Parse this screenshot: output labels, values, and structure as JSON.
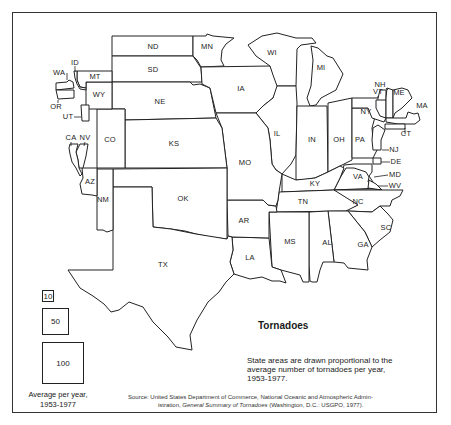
{
  "map": {
    "title": "Tornadoes",
    "caption": "State areas are drawn proportional to the average number of tornadoes per year, 1953-1977.",
    "source": {
      "prefix": "Source: United States Department of Commerce, National Oceanic and Atmospheric Admin-",
      "line2_start": "istration, ",
      "italic": "General Summary of Tornadoes",
      "line2_end": " (Washington, D.C.: USGPO, 1977)."
    },
    "legend": {
      "items": [
        {
          "label": "10",
          "size": 12
        },
        {
          "label": "50",
          "size": 27
        },
        {
          "label": "100",
          "size": 42
        }
      ],
      "caption_line1": "Average per year,",
      "caption_line2": "1953-1977"
    },
    "colors": {
      "stroke": "#222222",
      "fill": "#ffffff",
      "frame": "#333333"
    },
    "states": [
      {
        "id": "ND",
        "label": "ND",
        "label_xy": [
          153,
          47
        ],
        "points": "112,36 193,36 193,56 112,56"
      },
      {
        "id": "SD",
        "label": "SD",
        "label_xy": [
          153,
          70
        ],
        "points": "112,56 193,56 197,62 201,68 202,82 112,82"
      },
      {
        "id": "MN",
        "label": "MN",
        "label_xy": [
          207,
          47
        ],
        "points": "193,36 206,36 207,34 213,36 234,38 226,44 222,50 221,60 224,66 201,67 197,60 193,56"
      },
      {
        "id": "NE",
        "label": "NE",
        "label_xy": [
          160,
          102
        ],
        "points": "112,82 190,82 193,85 200,84 210,88 216,118 125,120 125,109 112,109"
      },
      {
        "id": "IA",
        "label": "IA",
        "label_xy": [
          241,
          89
        ],
        "points": "201,67 270,66 276,78 278,88 273,98 263,106 256,113 216,113 210,88 202,84"
      },
      {
        "id": "WI",
        "label": "WI",
        "label_xy": [
          272,
          53
        ],
        "points": "262,36 277,33 296,38 312,38 316,43 301,45 297,49 296,86 277,86 273,75 270,66 256,56 248,45"
      },
      {
        "id": "MI",
        "label": "MI",
        "label_xy": [
          321,
          68
        ],
        "points": "311,46 318,48 327,56 333,58 343,74 336,90 321,98 316,105 310,106 307,98 311,86 313,60"
      },
      {
        "id": "IL",
        "label": "IL",
        "label_xy": [
          277,
          134
        ],
        "points": "256,113 263,106 273,98 277,86 296,86 297,103 296,155 291,164 282,174 276,170 272,164 270,140 268,128"
      },
      {
        "id": "IN",
        "label": "IN",
        "label_xy": [
          312,
          140
        ],
        "points": "297,106 327,106 328,172 315,178 302,180 296,180 296,155"
      },
      {
        "id": "OH",
        "label": "OH",
        "label_xy": [
          339,
          140
        ],
        "points": "328,103 352,98 352,160 340,166 328,172"
      },
      {
        "id": "PA",
        "label": "PA",
        "label_xy": [
          360,
          140
        ],
        "points": "352,108 372,108 375,117 372,128 373,140 377,150 373,158 352,158"
      },
      {
        "id": "NY",
        "label": "NY",
        "label_xy": [
          366,
          112
        ],
        "points": "352,98 378,98 380,90 386,90 386,118 384,122 372,118 368,108 352,108"
      },
      {
        "id": "VT",
        "label": "VT",
        "label_xy": [
          378,
          92
        ],
        "points": "376,100 386,100 386,118 380,116 376,108"
      },
      {
        "id": "NH",
        "label": "NH",
        "label_xy": [
          380,
          85
        ],
        "points": "387,88 393,90 393,118 386,118 386,98"
      },
      {
        "id": "ME",
        "label": "ME",
        "label_xy": [
          399,
          93
        ],
        "points": "393,90 402,88 408,90 412,98 402,108 395,113 393,118"
      },
      {
        "id": "MA",
        "label": "MA",
        "label_xy": [
          422,
          106
        ],
        "points": "386,118 406,118 408,112 414,114 418,113 420,120 415,124 398,124 386,122"
      },
      {
        "id": "CT",
        "label": "CT",
        "label_xy": [
          406,
          134
        ],
        "points": "385,124 405,124 405,129 385,129"
      },
      {
        "id": "NJ",
        "label": "NJ",
        "label_xy": [
          394,
          150
        ],
        "points": "373,128 378,125 385,130 381,140 381,150 373,150 372,140"
      },
      {
        "id": "DE",
        "label": "DE",
        "label_xy": [
          396,
          162
        ],
        "points": "373,158 381,158 381,164 373,164"
      },
      {
        "id": "MD",
        "label": "MD",
        "label_xy": [
          395,
          175
        ],
        "points": "344,165 354,164 372,164 372,172 369,176 373,182 346,180 342,174"
      },
      {
        "id": "VA",
        "label": "VA",
        "label_xy": [
          358,
          177
        ],
        "points": "346,168 354,168 366,172 369,177 368,182 376,186 380,188 334,190 340,178"
      },
      {
        "id": "WV",
        "label": "WV",
        "label_xy": [
          395,
          186
        ],
        "points": "369,180 376,184 382,190 368,188"
      },
      {
        "id": "KY",
        "label": "KY",
        "label_xy": [
          315,
          184
        ],
        "points": "282,174 296,180 315,178 328,172 340,166 344,168 340,178 334,190 282,192"
      },
      {
        "id": "TN",
        "label": "TN",
        "label_xy": [
          303,
          202
        ],
        "points": "279,192 334,190 382,190 372,198 358,205 348,211 276,212 278,200"
      },
      {
        "id": "NC",
        "label": "NC",
        "label_xy": [
          358,
          202
        ],
        "points": "334,190 403,190 400,196 392,200 390,206 380,206 372,212 346,211 358,205"
      },
      {
        "id": "SC",
        "label": "SC",
        "label_xy": [
          386,
          228
        ],
        "points": "348,211 372,212 380,206 388,214 393,220 390,232 380,240 372,247 365,232"
      },
      {
        "id": "GA",
        "label": "GA",
        "label_xy": [
          363,
          245
        ],
        "points": "328,211 348,211 365,232 372,247 367,260 368,270 348,268 344,263 334,262"
      },
      {
        "id": "AL",
        "label": "AL",
        "label_xy": [
          327,
          243
        ],
        "points": "309,212 328,211 334,262 323,262 320,270 317,282 312,282 310,281 309,265"
      },
      {
        "id": "MS",
        "label": "MS",
        "label_xy": [
          290,
          242
        ],
        "points": "269,212 309,212 309,282 303,282 300,275 281,270 272,267"
      },
      {
        "id": "LA",
        "label": "LA",
        "label_xy": [
          250,
          258
        ],
        "points": "232,237 269,238 272,267 281,270 286,283 280,281 272,281 262,277 250,279 234,274 230,262 233,250"
      },
      {
        "id": "AR",
        "label": "AR",
        "label_xy": [
          244,
          221
        ],
        "points": "227,200 263,200 268,205 276,206 277,212 269,212 269,238 232,237 228,236"
      },
      {
        "id": "MO",
        "label": "MO",
        "label_xy": [
          245,
          163
        ],
        "points": "216,113 256,113 268,128 270,140 272,164 276,170 282,174 279,192 278,200 276,206 268,205 263,200 227,200 227,168 222,128"
      },
      {
        "id": "KS",
        "label": "KS",
        "label_xy": [
          174,
          144
        ],
        "points": "125,120 216,118 222,128 227,168 125,168"
      },
      {
        "id": "OK",
        "label": "OK",
        "label_xy": [
          183,
          199
        ],
        "points": "113,169 227,168 227,239 210,237 196,234 185,231 171,229 153,227 152,187 113,187"
      },
      {
        "id": "TX",
        "label": "TX",
        "label_xy": [
          163,
          265
        ],
        "points": "113,187 152,187 153,227 171,229 196,234 227,239 228,236 232,237 233,250 230,262 234,274 226,282 219,292 208,302 197,320 190,335 192,350 176,347 168,337 153,322 143,307 129,302 119,310 111,312 104,304 93,296 80,288 68,270 113,270"
      },
      {
        "id": "NM",
        "label": "NM",
        "label_xy": [
          103,
          200
        ],
        "points": "97,169 113,169 113,187 113,230 107,232 103,230 97,230"
      },
      {
        "id": "AZ",
        "label": "AZ",
        "label_xy": [
          90,
          182
        ],
        "points": "82,168 97,168 97,196 92,195 82,194 80,184 83,178"
      },
      {
        "id": "CO",
        "label": "CO",
        "label_xy": [
          110,
          140
        ],
        "points": "97,109 125,109 125,168 97,168"
      },
      {
        "id": "WY",
        "label": "WY",
        "label_xy": [
          99,
          95
        ],
        "points": "86,82 112,82 112,109 86,109"
      },
      {
        "id": "MT",
        "label": "MT",
        "label_xy": [
          95,
          77
        ],
        "points": "77,71 112,71 112,82 86,82 86,88 80,87 77,80"
      },
      {
        "id": "ID",
        "label": "ID",
        "label_xy": [
          75,
          63
        ],
        "points": "74,71 77,71 77,80 80,87 86,88 86,90 80,89 77,84 75,78"
      },
      {
        "id": "WA",
        "label": "WA",
        "label_xy": [
          59,
          73
        ],
        "points": "56,83 67,82 69,80 73,82 74,88 56,90"
      },
      {
        "id": "OR",
        "label": "OR",
        "label_xy": [
          56,
          107
        ],
        "points": "56,90 74,90 74,98 58,99"
      },
      {
        "id": "UT",
        "label": "UT",
        "label_xy": [
          68,
          117
        ],
        "points": "81,105 89,105 89,121 82,121"
      },
      {
        "id": "NV",
        "label": "NV",
        "label_xy": [
          85,
          138
        ],
        "points": "80,144 88,144 86,156 83,168 79,168 78,160 76,152"
      },
      {
        "id": "CA",
        "label": "CA",
        "label_xy": [
          71,
          138
        ],
        "points": "70,144 78,144 76,152 78,160 79,168 82,174 80,176 76,168 72,162 70,154 69,148"
      }
    ],
    "leaders": [
      {
        "from": [
          67,
          73
        ],
        "to": [
          67,
          80
        ]
      },
      {
        "from": [
          75,
          66
        ],
        "to": [
          75,
          72
        ]
      },
      {
        "from": [
          58,
          100
        ],
        "to": [
          58,
          103
        ]
      },
      {
        "from": [
          74,
          117
        ],
        "to": [
          81,
          117
        ]
      },
      {
        "from": [
          71,
          142
        ],
        "to": [
          71,
          146
        ]
      },
      {
        "from": [
          85,
          142
        ],
        "to": [
          84,
          146
        ]
      },
      {
        "from": [
          378,
          96
        ],
        "to": [
          378,
          100
        ]
      },
      {
        "from": [
          386,
          88
        ],
        "to": [
          388,
          90
        ]
      },
      {
        "from": [
          389,
          150
        ],
        "to": [
          382,
          150
        ]
      },
      {
        "from": [
          390,
          162
        ],
        "to": [
          381,
          162
        ]
      },
      {
        "from": [
          388,
          175
        ],
        "to": [
          374,
          177
        ]
      },
      {
        "from": [
          388,
          186
        ],
        "to": [
          378,
          186
        ]
      },
      {
        "from": [
          405,
          134
        ],
        "to": [
          405,
          128
        ]
      }
    ]
  }
}
